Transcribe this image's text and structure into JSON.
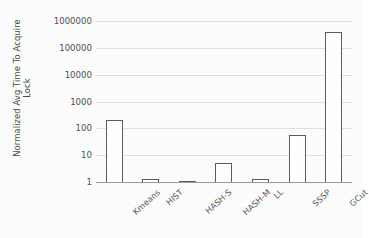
{
  "chart_data": {
    "type": "bar",
    "title": "",
    "xlabel": "",
    "ylabel": "Normalized Avg Time To Acquire Lock",
    "ylabel_line1": "Normalized Avg Time To Acquire",
    "ylabel_line2": "Lock",
    "yscale": "log",
    "ylim": [
      1,
      1000000
    ],
    "ytick_labels": [
      "1",
      "10",
      "100",
      "1000",
      "10000",
      "100000",
      "1000000"
    ],
    "ytick_values": [
      1,
      10,
      100,
      1000,
      10000,
      100000,
      1000000
    ],
    "grid": true,
    "legend": "none",
    "categories": [
      "Kmeans",
      "HIST",
      "HASH-S",
      "HASH-M",
      "LL",
      "SSSP",
      "GCut"
    ],
    "values": [
      200,
      1.3,
      1,
      5,
      1.3,
      55,
      400000
    ],
    "series": [
      {
        "name": "Normalized Avg Time To Acquire Lock",
        "values": [
          200,
          1.3,
          1,
          5,
          1.3,
          55,
          400000
        ]
      }
    ],
    "bar_style": {
      "fill": "#ffffff",
      "edge": "#5c5c5c"
    },
    "colors": {
      "gridline": "#dcdcdc",
      "baseline": "#9a9a9a",
      "text": "#4f4f4f",
      "background": "#fdfdfd"
    }
  }
}
